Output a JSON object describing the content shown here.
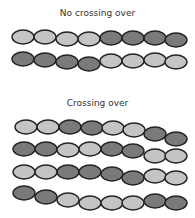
{
  "colors": {
    "light": "#c4c4c4",
    "dark": "#7a7a7a",
    "stroke": "#222222"
  },
  "sections": [
    {
      "title": "No crossing over",
      "chromosomes": [
        {
          "segments": [
            "light",
            "light",
            "light",
            "light",
            "dark",
            "dark",
            "dark",
            "dark"
          ]
        },
        {
          "segments": [
            "dark",
            "dark",
            "dark",
            "dark",
            "light",
            "light",
            "light",
            "light"
          ]
        }
      ]
    },
    {
      "title": "Crossing over",
      "chromosomes": [
        {
          "segments": [
            "light",
            "light",
            "dark",
            "dark",
            "light",
            "light",
            "dark",
            "dark"
          ]
        },
        {
          "segments": [
            "dark",
            "dark",
            "light",
            "light",
            "dark",
            "dark",
            "light",
            "light"
          ]
        },
        {
          "segments": [
            "light",
            "light",
            "dark",
            "dark",
            "dark",
            "dark",
            "light",
            "light"
          ]
        },
        {
          "segments": [
            "dark",
            "dark",
            "light",
            "light",
            "light",
            "light",
            "dark",
            "dark"
          ]
        }
      ]
    }
  ]
}
